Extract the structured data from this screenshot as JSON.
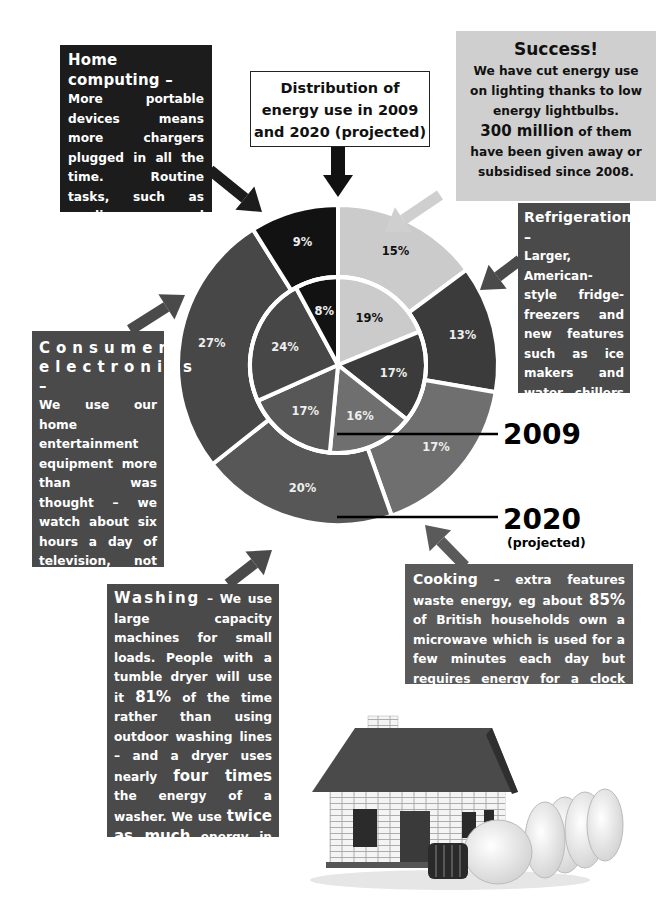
{
  "title": {
    "line1": "Distribution of",
    "line2": "energy use in 2009",
    "line3": "and 2020 (projected)"
  },
  "boxes": {
    "home_computing": {
      "heading": "Home computing –",
      "body": "More portable devices means more chargers plugged in all the time. Routine tasks, such as reading and shopping, now done on gadgets, will mean more demand."
    },
    "success": {
      "heading": "Success!",
      "line1": "We have cut energy use on lighting thanks to low energy lightbulbs.",
      "highlight": "300 million",
      "line2": "of them",
      "line3": "have been given away or subsidised since 2008."
    },
    "refrigeration": {
      "heading": "Refrigeration –",
      "body": "Larger, American-style fridge-freezers and new features such as ice makers and water chillers will consume more energy."
    },
    "consumer_electronics": {
      "heading": "Consumer electronics –",
      "body1": "We use our home entertainment equipment more than was thought – we watch about six hours a day of television, not five. That's an extra",
      "highlight": "400 hours",
      "body2": "of viewing per household."
    },
    "cooking": {
      "heading": "Cooking",
      "body1": "– extra features waste energy, eg about",
      "highlight": "85%",
      "body2": "of British households own a microwave which is used for a few minutes each day but requires energy for a clock and electronic controls."
    },
    "washing": {
      "heading": "Washing",
      "body1": "– We use large capacity machines for small loads. People with a tumble dryer will use it",
      "highlight1": "81%",
      "body2": "of the time rather than using outdoor washing lines – and a dryer uses nearly",
      "highlight2": "four times",
      "body3": "the energy of a washer. We use",
      "highlight3": "twice as much",
      "body4": "energy in dishwashers as in washing machines."
    }
  },
  "legend": {
    "inner_label": "2009",
    "outer_label": "2020",
    "outer_sub": "(projected)"
  },
  "colors": {
    "lighting": "#cbcbcb",
    "refrigeration": "#3b3b3b",
    "cooking": "#6f6f6f",
    "washing": "#575757",
    "consumer_electronics": "#474747",
    "home_computing": "#121212"
  },
  "chart_data": {
    "type": "pie",
    "subtype": "nested-donut",
    "title": "Distribution of energy use in 2009 and 2020 (projected)",
    "categories": [
      "Lighting",
      "Refrigeration",
      "Cooking",
      "Washing",
      "Consumer electronics",
      "Home computing"
    ],
    "series": [
      {
        "name": "2009",
        "ring": "inner",
        "values": [
          19,
          17,
          16,
          17,
          24,
          8
        ]
      },
      {
        "name": "2020 (projected)",
        "ring": "outer",
        "values": [
          15,
          13,
          17,
          20,
          27,
          9
        ]
      }
    ],
    "unit": "%",
    "start_angle": "12 o'clock, clockwise"
  }
}
